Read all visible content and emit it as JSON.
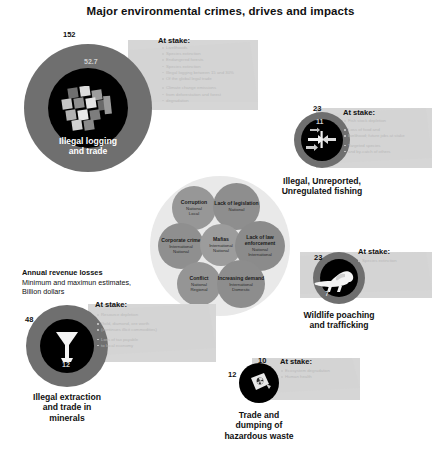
{
  "title": "Major environmental crimes, drives and impacts",
  "legend": {
    "line1": "Annual revenue losses",
    "line2": "Minimum and maximun estimates,",
    "line3": "Billion dollars"
  },
  "at_stake_label": "At stake:",
  "colors": {
    "ring": "#6e6e6e",
    "ring_light": "#8a8a8a",
    "core": "#0a0a0a",
    "panel": "#cfcfcf",
    "halo": "#e9e9e9",
    "bubble": "#9a9a9a",
    "bubble_alt": "#8f8f8f",
    "text": "#111111"
  },
  "nodes": [
    {
      "id": "illegal-logging",
      "name": "Illegal logging and trade",
      "caption": [
        "Illegal logging",
        "and trade"
      ],
      "icon": "timber-stack-icon",
      "max": "152",
      "min": "52.7",
      "at_stake": [
        "Livelihoods",
        "Species extinction",
        "Endangered forests",
        "Species extinction",
        "Illegal logging between 15 and 30%",
        "Of the global legal trade",
        "",
        "Climate change emissions",
        "from deforestation and forest",
        "degradation"
      ]
    },
    {
      "id": "iuu-fishing",
      "name": "Illegal, Unreported, Unregulated fishing",
      "caption": [
        "Illegal, Unreported,",
        "Unregulated fishing"
      ],
      "icon": "fish-arrows-icon",
      "max": "23",
      "min": "11",
      "at_stake": [
        "Fish stock depletion",
        "",
        "Loss of food and",
        "livelihood; future jobs at stake",
        "",
        "Targeted species",
        "and by-catch of others"
      ]
    },
    {
      "id": "wildlife-poaching",
      "name": "Wildlife poaching and trafficking",
      "caption": [
        "Wildlife poaching",
        "and trafficking"
      ],
      "icon": "elephant-icon",
      "max": "23",
      "min": "7",
      "at_stake": [
        "Species extinction"
      ]
    },
    {
      "id": "hazardous-waste",
      "name": "Trade and dumping of hazardous waste",
      "caption": [
        "Trade and",
        "dumping of",
        "hazardous waste"
      ],
      "icon": "toxic-barrel-icon",
      "max": "10",
      "min": "12",
      "at_stake": [
        "Ecosystem degradation",
        "Human health"
      ]
    },
    {
      "id": "minerals",
      "name": "Illegal extraction and trade in minerals",
      "caption": [
        "Illegal extraction",
        "and trade in",
        "minerals"
      ],
      "icon": "mineral-funnel-icon",
      "max": "48",
      "min": "12",
      "at_stake": [
        "Resource depletion",
        "",
        "Gold, diamond, ore worth",
        "(continues illicit commodities)",
        "",
        "Loss of tax payable",
        "to local economy"
      ]
    }
  ],
  "drivers": [
    {
      "id": "corruption",
      "title": "Corruption",
      "sub": [
        "National",
        "Local"
      ]
    },
    {
      "id": "legislation",
      "title": "Lack of legislation",
      "sub": [
        "National"
      ]
    },
    {
      "id": "corporate",
      "title": "Corporate crime",
      "sub": [
        "International",
        "National"
      ]
    },
    {
      "id": "mafias",
      "title": "Mafias",
      "sub": [
        "International",
        "National"
      ]
    },
    {
      "id": "enforcement",
      "title": "Lack of law enforcement",
      "sub": [
        "National",
        "International"
      ]
    },
    {
      "id": "conflict",
      "title": "Conflict",
      "sub": [
        "National",
        "Regional"
      ]
    },
    {
      "id": "demand",
      "title": "Increasing demand",
      "sub": [
        "International",
        "Domestic"
      ]
    }
  ]
}
